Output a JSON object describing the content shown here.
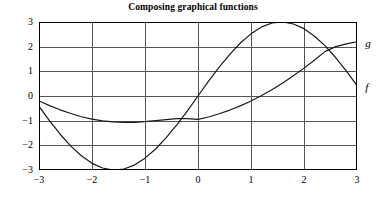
{
  "chart_data": {
    "type": "line",
    "title": "Composing graphical functions",
    "xlabel": "",
    "ylabel": "",
    "xlim": [
      -3,
      3
    ],
    "ylim": [
      -3,
      3
    ],
    "xticks": [
      -3,
      -2,
      -1,
      0,
      1,
      2,
      3
    ],
    "yticks": [
      -3,
      -2,
      -1,
      0,
      1,
      2,
      3
    ],
    "xtick_labels": [
      "−3",
      "−2",
      "−1",
      "0",
      "1",
      "2",
      "3"
    ],
    "ytick_labels": [
      "3",
      "2",
      "1",
      "0",
      "−1",
      "−2",
      "−3"
    ],
    "grid": true,
    "grid_color": "#555555",
    "frame_color": "#000000",
    "legend_position": "right-of-axes-inline",
    "series": [
      {
        "name": "g",
        "label": "g",
        "color": "#1a1a1a",
        "comment": "sine-like wave, amplitude 3",
        "x": [
          -3.0,
          -2.8,
          -2.6,
          -2.4,
          -2.2,
          -2.0,
          -1.8,
          -1.6,
          -1.4,
          -1.2,
          -1.0,
          -0.8,
          -0.6,
          -0.4,
          -0.2,
          0.0,
          0.2,
          0.4,
          0.6,
          0.8,
          1.0,
          1.2,
          1.4,
          1.6,
          1.8,
          2.0,
          2.2,
          2.4,
          2.6,
          2.8,
          3.0
        ],
        "values": [
          -0.42,
          -1.01,
          -1.55,
          -2.03,
          -2.42,
          -2.73,
          -2.92,
          -3.0,
          -2.96,
          -2.8,
          -2.52,
          -2.15,
          -1.69,
          -1.17,
          -0.6,
          0.0,
          0.6,
          1.17,
          1.69,
          2.15,
          2.52,
          2.8,
          2.96,
          3.0,
          2.92,
          2.73,
          2.42,
          2.03,
          1.55,
          1.01,
          0.42
        ]
      },
      {
        "name": "f",
        "label": "f",
        "color": "#1a1a1a",
        "comment": "upward-opening parabola-like curve, minimum near x = -1.2",
        "x": [
          -3.0,
          -2.8,
          -2.6,
          -2.4,
          -2.2,
          -2.0,
          -1.8,
          -1.6,
          -1.4,
          -1.2,
          -1.0,
          -0.8,
          -0.6,
          -0.4,
          -0.2,
          0.0,
          0.2,
          0.4,
          0.6,
          0.8,
          1.0,
          1.2,
          1.4,
          1.6,
          1.8,
          2.0,
          2.2,
          2.4,
          2.6,
          2.8,
          3.0
        ],
        "values": [
          -0.2,
          -0.39,
          -0.56,
          -0.71,
          -0.84,
          -0.94,
          -1.01,
          -1.05,
          -1.07,
          -1.07,
          -1.04,
          -1.0,
          -0.96,
          -0.92,
          -0.92,
          -0.95,
          -0.85,
          -0.72,
          -0.57,
          -0.4,
          -0.2,
          0.02,
          0.26,
          0.53,
          0.82,
          1.13,
          1.46,
          1.81,
          2.0,
          2.11,
          2.2
        ]
      }
    ],
    "annotations": [
      {
        "text": "g",
        "x": 3.08,
        "y": 2.05
      },
      {
        "text": "f",
        "x": 3.08,
        "y": 0.3
      }
    ]
  },
  "labels": {
    "title": "Composing graphical functions",
    "curve_g": "g",
    "curve_f": "f"
  }
}
